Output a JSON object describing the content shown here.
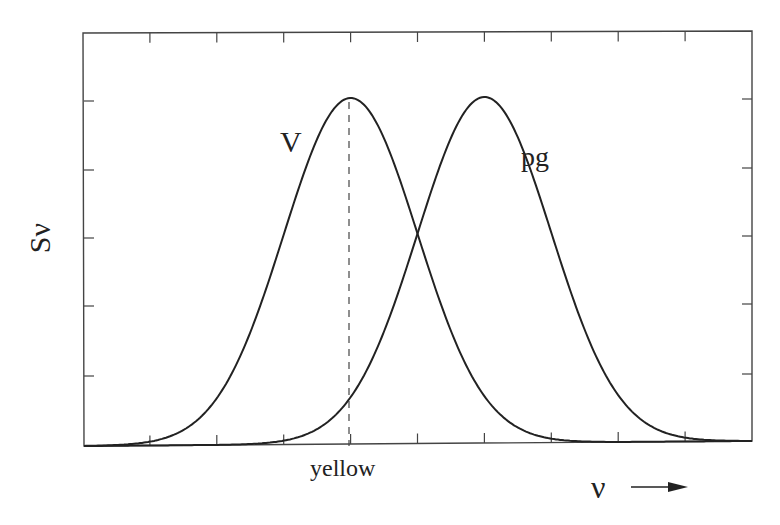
{
  "chart_data": {
    "type": "line",
    "title": "",
    "xlabel": "ν",
    "ylabel": "Sν",
    "x_arrow": "→",
    "grid": false,
    "legend": "inline labels",
    "xlim": [
      0,
      10
    ],
    "ylim": [
      0,
      1.15
    ],
    "x_ticks_count": 9,
    "y_ticks_count": 5,
    "tick_labels_shown": false,
    "series": [
      {
        "name": "V",
        "shape": "gaussian",
        "center": 4,
        "sigma": 1.0,
        "peak": 1.0
      },
      {
        "name": "pg",
        "shape": "gaussian",
        "center": 6,
        "sigma": 1.0,
        "peak": 1.0
      }
    ],
    "annotations": [
      {
        "type": "vertical-dashed-line",
        "x": 4,
        "label": "yellow"
      },
      {
        "type": "intersection",
        "x": 5,
        "y": 0.607
      }
    ]
  },
  "labels": {
    "y_axis": "Sν",
    "x_axis": "ν",
    "marker": "yellow",
    "series_v": "V",
    "series_pg": "pg"
  },
  "colors": {
    "line": "#222222",
    "frame": "#444444",
    "background": "#ffffff"
  }
}
